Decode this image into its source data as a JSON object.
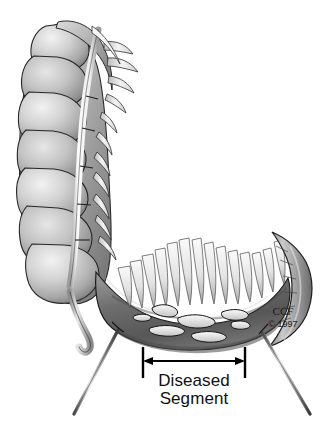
{
  "figure": {
    "background_color": "#ffffff"
  },
  "annotation": {
    "measure_label_line1": "Diseased",
    "measure_label_line2": "Segment",
    "arrow": {
      "style": "double-headed",
      "x_start": 143,
      "x_end": 245,
      "y": 361,
      "left_tick_x": 143,
      "right_tick_x": 245,
      "tick_top": 347,
      "tick_bottom": 378,
      "color": "#000000"
    }
  },
  "credit": {
    "organization": "CCF",
    "copyright": "© 1997"
  },
  "anatomy": {
    "parts": [
      {
        "name": "ascending-colon",
        "label": "Ascending colon with haustra"
      },
      {
        "name": "taenia-coli",
        "label": "Taenia coli"
      },
      {
        "name": "haustra",
        "label": "Haustral sacculations",
        "count": 8
      },
      {
        "name": "appendices-epiploicae",
        "label": "Appendices epiploicae"
      },
      {
        "name": "cecum",
        "label": "Cecum"
      },
      {
        "name": "appendix",
        "label": "Vermiform appendix"
      },
      {
        "name": "opened-bowel",
        "label": "Opened bowel lumen"
      },
      {
        "name": "villi",
        "label": "Mucosal folds and villi"
      },
      {
        "name": "ulcerations",
        "label": "Ulcerated diseased mucosa",
        "count": 7
      },
      {
        "name": "retractor-left",
        "label": "Left retractor probe"
      },
      {
        "name": "retractor-right",
        "label": "Right retractor probe"
      }
    ]
  },
  "palette": {
    "background": "#ffffff",
    "outline": "#1d1d1d",
    "bowel_light": "#e8e8e8",
    "bowel_mid": "#b4b4b4",
    "bowel_dark": "#7a7a7a",
    "diseased_dark": "#5f5f5f",
    "ulcer_white": "#f2f2f2",
    "taenia": "#fbfbfb",
    "instrument": "#8c8c8c"
  }
}
